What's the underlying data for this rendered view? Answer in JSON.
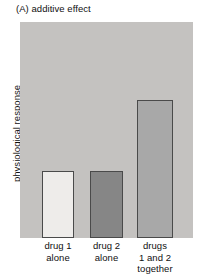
{
  "figure": {
    "title": "(A) additive effect",
    "y_axis_label": "physiological response"
  },
  "colors": {
    "plot_background": "#c4c2c0",
    "bar_border": "#4a4a4a",
    "bar_1_fill": "#eeecea",
    "bar_2_fill": "#868686",
    "bar_3_fill": "#a8a8a8",
    "text": "#101010",
    "page_background": "#ffffff"
  },
  "chart_data": {
    "type": "bar",
    "title": "(A) additive effect",
    "xlabel": "",
    "ylabel": "physiological response",
    "categories": [
      "drug 1 alone",
      "drug 2 alone",
      "drugs 1 and 2 together"
    ],
    "category_label_lines": [
      [
        "drug 1",
        "alone"
      ],
      [
        "drug 2",
        "alone"
      ],
      [
        "drugs",
        "1 and 2",
        "together"
      ]
    ],
    "values": [
      31,
      31,
      64
    ],
    "ylim": [
      0,
      100
    ],
    "grid": false,
    "legend": false,
    "axis_tick_labels": false,
    "bar_fills": [
      "#eeecea",
      "#868686",
      "#a8a8a8"
    ],
    "annotation": "Bars 1 and 2 are equal height; the combined bar equals their sum (additive effect)."
  }
}
